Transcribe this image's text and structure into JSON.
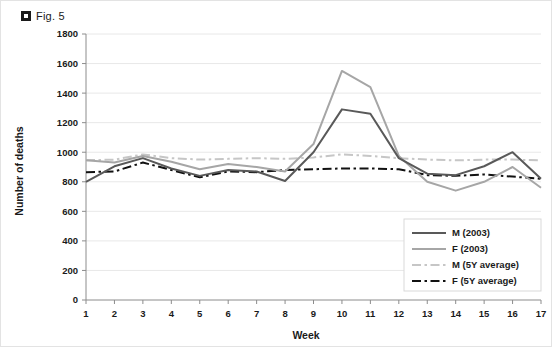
{
  "figure": {
    "icon": "square-bullet-icon",
    "caption": "Fig. 5"
  },
  "chart_data": {
    "type": "line",
    "title": "",
    "xlabel": "Week",
    "ylabel": "Number of deaths",
    "x": [
      1,
      2,
      3,
      4,
      5,
      6,
      7,
      8,
      9,
      10,
      11,
      12,
      13,
      14,
      15,
      16,
      17
    ],
    "xtick_labels": [
      "1",
      "2",
      "3",
      "4",
      "5",
      "6",
      "7",
      "8",
      "9",
      "10",
      "11",
      "12",
      "13",
      "14",
      "15",
      "16",
      "17"
    ],
    "ytick_labels": [
      "0",
      "200",
      "400",
      "600",
      "800",
      "1000",
      "1200",
      "1400",
      "1600",
      "1800"
    ],
    "ylim": [
      0,
      1800
    ],
    "ytick_step": 200,
    "xlim": [
      1,
      17
    ],
    "grid": "horizontal",
    "legend_position": "bottom-right",
    "series": [
      {
        "name": "M (2003)",
        "key": "m_2003",
        "color": "#595959",
        "style": "solid",
        "width": 2,
        "values": [
          800,
          905,
          960,
          890,
          840,
          880,
          870,
          805,
          1000,
          1290,
          1260,
          960,
          855,
          845,
          905,
          1000,
          820
        ]
      },
      {
        "name": "F  (2003)",
        "key": "f_2003",
        "color": "#a6a6a6",
        "style": "solid",
        "width": 2,
        "values": [
          945,
          930,
          975,
          935,
          885,
          920,
          900,
          870,
          1055,
          1550,
          1440,
          975,
          800,
          740,
          800,
          900,
          760
        ]
      },
      {
        "name": "M (5Y average)",
        "key": "m_5y_avg",
        "color": "#c6c6c6",
        "style": "dash-dot",
        "width": 2,
        "values": [
          945,
          950,
          985,
          960,
          950,
          955,
          960,
          955,
          965,
          985,
          975,
          960,
          950,
          945,
          950,
          950,
          945
        ]
      },
      {
        "name": "F (5Y average)",
        "key": "f_5y_avg",
        "color": "#111111",
        "style": "dash-dot",
        "width": 2,
        "values": [
          865,
          870,
          930,
          880,
          830,
          870,
          865,
          880,
          885,
          890,
          890,
          885,
          845,
          840,
          850,
          835,
          820
        ]
      }
    ]
  }
}
